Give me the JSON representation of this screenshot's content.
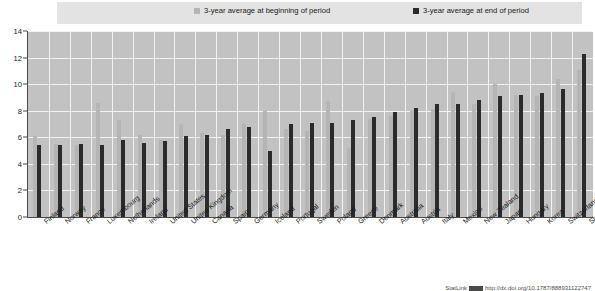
{
  "legend": {
    "items": [
      {
        "label": "3-year average at beginning of period",
        "color": "#b5b5b5",
        "icon": "square-swatch-icon"
      },
      {
        "label": "3-year average at end of period",
        "color": "#2b2b2b",
        "icon": "square-swatch-icon"
      }
    ]
  },
  "footer": {
    "text": "StatLink",
    "url_text": "http://dx.doi.org/10.1787/888931122747"
  },
  "chart_data": {
    "type": "bar",
    "title": "",
    "xlabel": "",
    "ylabel": "",
    "ylim": [
      0,
      14
    ],
    "yticks": [
      0,
      2,
      4,
      6,
      8,
      10,
      12,
      14
    ],
    "grid": true,
    "legend_position": "top",
    "categories": [
      "Finland",
      "Norway",
      "France",
      "Luxembourg",
      "Netherlands",
      "Ireland",
      "United States",
      "United Kingdom",
      "Canada",
      "Spain",
      "Germany",
      "Iceland",
      "Portugal",
      "Sweden",
      "Poland",
      "Greece",
      "Denmark",
      "Australia",
      "Austria",
      "Italy",
      "Mexico",
      "New Zealand",
      "Japan",
      "Hungary",
      "Korea",
      "Switzerland",
      "Slovak Republic"
    ],
    "series": [
      {
        "name": "3-year average at beginning of period",
        "color": "#b5b5b5",
        "values": [
          6.1,
          5.5,
          5.4,
          8.6,
          7.3,
          6.2,
          5.8,
          7.0,
          6.3,
          6.2,
          7.0,
          8.0,
          6.6,
          6.5,
          8.7,
          5.2,
          7.4,
          7.6,
          8.0,
          8.1,
          9.4,
          8.5,
          10.0,
          9.2,
          9.1,
          10.4,
          11.1
        ]
      },
      {
        "name": "3-year average at end of period",
        "color": "#2b2b2b",
        "values": [
          5.4,
          5.4,
          5.5,
          5.4,
          5.8,
          5.6,
          5.7,
          6.1,
          6.2,
          6.6,
          6.8,
          5.0,
          7.0,
          7.1,
          7.1,
          7.3,
          7.5,
          7.9,
          8.2,
          8.5,
          8.5,
          8.8,
          9.1,
          9.2,
          9.3,
          9.6,
          12.3
        ]
      }
    ]
  }
}
